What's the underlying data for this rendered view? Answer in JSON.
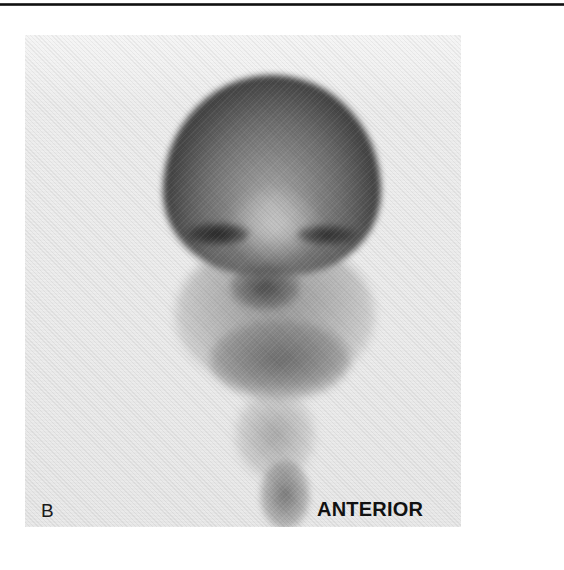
{
  "figure": {
    "panel_letter": "B",
    "view_label": "ANTERIOR",
    "image_type": "nuclear medicine scintigraphy",
    "colors": {
      "background": "#ffffff",
      "panel_background": "#ececec",
      "label_text": "#111111",
      "top_rule": "#111111"
    }
  }
}
